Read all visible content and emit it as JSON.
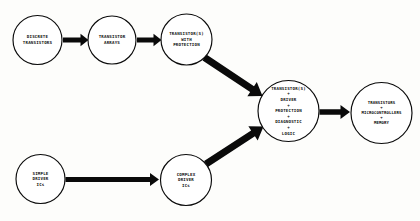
{
  "diagram": {
    "background_color": "#fdfdfb",
    "ink_color": "#0a0a0a",
    "nodes": [
      {
        "id": "discrete-transistors",
        "lines": [
          "DISCRETE",
          "TRANSISTORS"
        ],
        "cx": 37.5,
        "cy": 40.0,
        "r": 24.5
      },
      {
        "id": "transistor-arrays",
        "lines": [
          "TRANSISTOR",
          "ARRAYS"
        ],
        "cx": 112.0,
        "cy": 40.0,
        "r": 24.0
      },
      {
        "id": "transistors-with-protection",
        "lines": [
          "TRANSISTOR(S)",
          "WITH",
          "PROTECTION"
        ],
        "cx": 186.5,
        "cy": 39.5,
        "r": 25.5
      },
      {
        "id": "simple-driver-ics",
        "lines": [
          "SIMPLE",
          "DRIVER",
          "ICs"
        ],
        "cx": 40.5,
        "cy": 179.0,
        "r": 24.5
      },
      {
        "id": "complex-driver-ics",
        "lines": [
          "COMPLEX",
          "DRIVER",
          "ICs"
        ],
        "cx": 186.0,
        "cy": 180.0,
        "r": 25.5
      },
      {
        "id": "driver-protection-diagnostic-logic",
        "lines": [
          "TRANSISTOR(S)",
          "+",
          "DRIVER",
          "+",
          "PROTECTION",
          "+",
          "DIAGNOSTIC",
          "+",
          "LOGIC"
        ],
        "cx": 288.5,
        "cy": 111.0,
        "r": 30.5
      },
      {
        "id": "transistors-microcontrollers-memory",
        "lines": [
          "TRANSISTORS",
          "+",
          "MICROCONTROLLERS",
          "+",
          "MEMORY"
        ],
        "cx": 381.5,
        "cy": 113.0,
        "r": 30.5
      }
    ],
    "edges": [
      {
        "id": "discrete-to-arrays",
        "from": "discrete-transistors",
        "to": "transistor-arrays",
        "style": "straight-horizontal",
        "x1": 63.0,
        "y1": 40.0,
        "x2": 88.5,
        "y2": 40.0,
        "shaft": 5.0,
        "head_len": 8.0,
        "head_w": 12.5
      },
      {
        "id": "arrays-to-protection",
        "from": "transistor-arrays",
        "to": "transistors-with-protection",
        "style": "straight-horizontal",
        "x1": 137.0,
        "y1": 40.0,
        "x2": 161.5,
        "y2": 40.0,
        "shaft": 5.0,
        "head_len": 8.0,
        "head_w": 12.5
      },
      {
        "id": "protection-to-core",
        "from": "transistors-with-protection",
        "to": "driver-protection-diagnostic-logic",
        "style": "diagonal-down-right",
        "x1": 204.5,
        "y1": 57.5,
        "x2": 262.5,
        "y2": 96.0,
        "shaft": 7.0,
        "head_len": 12.5,
        "head_w": 17.0
      },
      {
        "id": "simple-to-complex",
        "from": "simple-driver-ics",
        "to": "complex-driver-ics",
        "style": "straight-horizontal",
        "x1": 65.5,
        "y1": 179.5,
        "x2": 159.0,
        "y2": 179.5,
        "shaft": 5.0,
        "head_len": 9.0,
        "head_w": 13.0
      },
      {
        "id": "complex-to-core",
        "from": "complex-driver-ics",
        "to": "driver-protection-diagnostic-logic",
        "style": "diagonal-up-right",
        "x1": 206.0,
        "y1": 164.0,
        "x2": 263.5,
        "y2": 126.5,
        "shaft": 7.0,
        "head_len": 12.5,
        "head_w": 17.0
      },
      {
        "id": "core-to-microcontrollers",
        "from": "driver-protection-diagnostic-logic",
        "to": "transistors-microcontrollers-memory",
        "style": "straight-horizontal",
        "x1": 319.5,
        "y1": 112.0,
        "x2": 350.0,
        "y2": 112.0,
        "shaft": 5.5,
        "head_len": 9.5,
        "head_w": 14.0
      }
    ]
  }
}
